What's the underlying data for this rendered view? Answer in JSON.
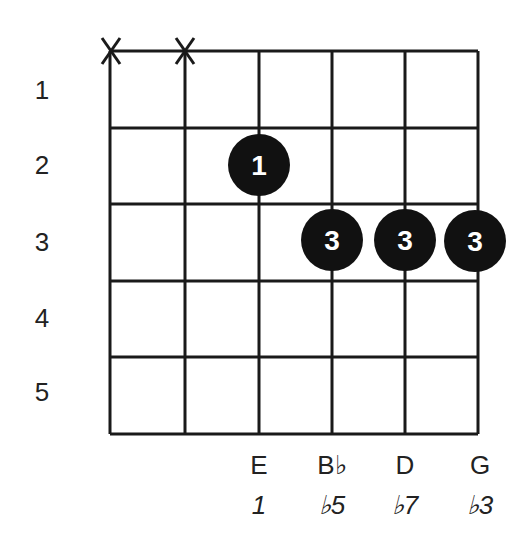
{
  "diagram": {
    "type": "guitar-chord-diagram",
    "fret_labels": [
      "1",
      "2",
      "3",
      "4",
      "5"
    ],
    "strings": [
      {
        "index": 6,
        "marker": "X",
        "note": "",
        "interval": ""
      },
      {
        "index": 5,
        "marker": "X",
        "note": "",
        "interval": ""
      },
      {
        "index": 4,
        "fret": 2,
        "finger": "1",
        "note": "E",
        "interval": "1"
      },
      {
        "index": 3,
        "fret": 3,
        "finger": "3",
        "note": "B♭",
        "interval": "♭5"
      },
      {
        "index": 2,
        "fret": 3,
        "finger": "3",
        "note": "D",
        "interval": "♭7"
      },
      {
        "index": 1,
        "fret": 3,
        "finger": "3",
        "note": "G",
        "interval": "♭3"
      }
    ],
    "notes": [
      "E",
      "B♭",
      "D",
      "G"
    ],
    "intervals": [
      "1",
      "♭5",
      "♭7",
      "♭3"
    ],
    "muted_marker": "X",
    "dots": [
      {
        "string": 4,
        "fret": 2,
        "finger": "1"
      },
      {
        "string": 3,
        "fret": 3,
        "finger": "3"
      },
      {
        "string": 2,
        "fret": 3,
        "finger": "3"
      },
      {
        "string": 1,
        "fret": 3,
        "finger": "3"
      }
    ],
    "colors": {
      "line": "#1a1a1a",
      "dot": "#111111",
      "dot_text": "#ffffff"
    }
  }
}
